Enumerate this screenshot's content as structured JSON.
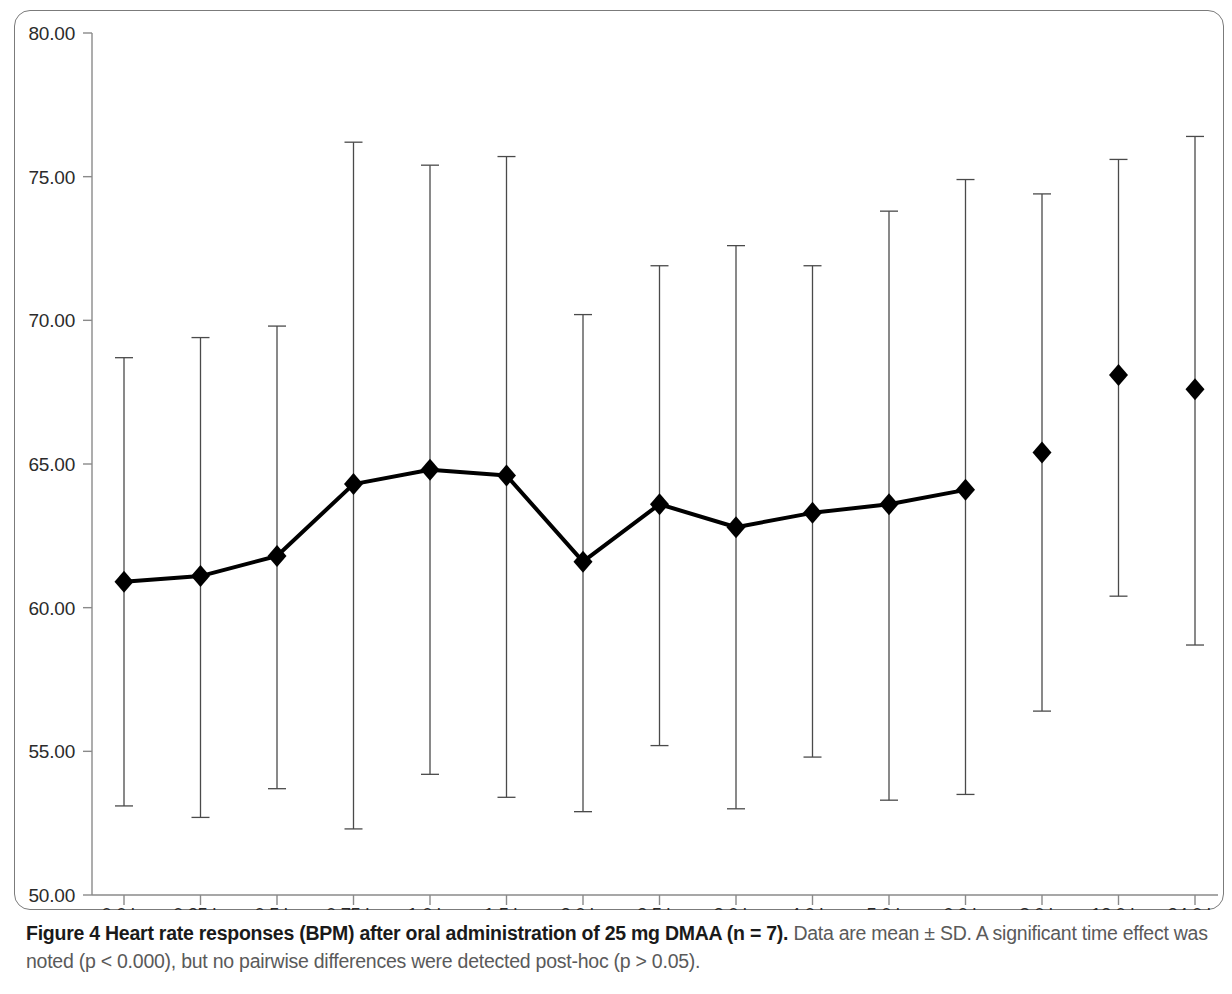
{
  "figure": {
    "caption_bold": "Figure 4 Heart rate responses (BPM) after oral administration of 25 mg DMAA (n = 7).",
    "caption_rest": " Data are mean ± SD. A significant time effect was noted (p < 0.000), but no pairwise differences were detected post-hoc (p > 0.05).",
    "frame_color": "#7b7b7b"
  },
  "chart_data": {
    "type": "line",
    "title": "",
    "subtitle": "",
    "xlabel": "",
    "ylabel": "",
    "grid": false,
    "legend": "none",
    "marker": "filled-diamond",
    "error_bars": "mean ± SD",
    "series_color": "#000000",
    "ylim": [
      50.0,
      80.0
    ],
    "ytick_labels": [
      "80.00",
      "75.00",
      "70.00",
      "65.00",
      "60.00",
      "55.00",
      "50.00"
    ],
    "yticks": [
      80.0,
      75.0,
      70.0,
      65.0,
      60.0,
      55.0,
      50.0
    ],
    "categories": [
      "0.0 hr",
      "0.25 hr",
      "0.5 hr",
      "0.75 hr",
      "1.0 hr",
      "1.5 hr",
      "2.0 hr",
      "2.5 hr",
      "3.0 hr",
      "4.0 hr",
      "5.0 hr",
      "6.0 hr",
      "8.0 hr",
      "12.0 hr",
      "24.0 hr"
    ],
    "series": [
      {
        "name": "Heart rate (BPM)",
        "values": [
          60.9,
          61.1,
          61.8,
          64.3,
          64.8,
          64.6,
          61.6,
          63.6,
          62.8,
          63.3,
          63.6,
          64.1,
          65.4,
          68.1,
          67.6
        ],
        "err_upper": [
          68.7,
          69.4,
          69.8,
          76.2,
          75.4,
          75.7,
          70.2,
          71.9,
          72.6,
          71.9,
          73.8,
          74.9,
          74.4,
          75.6,
          76.4
        ],
        "err_lower": [
          53.1,
          52.7,
          53.7,
          52.3,
          54.2,
          53.4,
          52.9,
          55.2,
          53.0,
          54.8,
          53.3,
          53.5,
          56.4,
          60.4,
          58.7
        ],
        "connected_through_index": 11
      }
    ]
  }
}
